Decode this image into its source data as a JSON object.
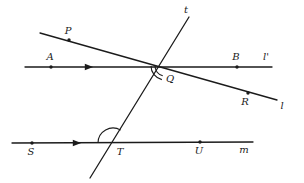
{
  "figure": {
    "kind": "geometry-diagram",
    "background_color": "#ffffff",
    "stroke_color": "#1b1b1b",
    "label_color": "#1b1b1b"
  },
  "lines": [
    {
      "name": "line-l-prime",
      "label": "l'",
      "label_x": 266,
      "label_y": 57,
      "x1": 25,
      "y1": 67,
      "x2": 272,
      "y2": 67,
      "tick_marks": 1
    },
    {
      "name": "line-l",
      "label": "l",
      "label_x": 282,
      "label_y": 106,
      "x1": 40,
      "y1": 33,
      "x2": 277,
      "y2": 100,
      "tick_marks": 0
    },
    {
      "name": "line-m",
      "label": "m",
      "label_x": 244,
      "label_y": 150,
      "x1": 12,
      "y1": 143,
      "x2": 253,
      "y2": 142,
      "tick_marks": 1
    },
    {
      "name": "line-t",
      "label": "t",
      "label_x": 186,
      "label_y": 10,
      "x1": 90,
      "y1": 178,
      "x2": 189,
      "y2": 17,
      "tick_marks": 0
    }
  ],
  "points": [
    {
      "name": "point-p",
      "label": "P",
      "x": 69,
      "y": 40,
      "label_x": 68,
      "label_y": 31,
      "dot": true
    },
    {
      "name": "point-a",
      "label": "A",
      "x": 51,
      "y": 67,
      "label_x": 50,
      "label_y": 57,
      "dot": true
    },
    {
      "name": "point-b",
      "label": "B",
      "x": 237,
      "y": 67,
      "label_x": 236,
      "label_y": 57,
      "dot": true
    },
    {
      "name": "point-q",
      "label": "Q",
      "x": 165,
      "y": 66,
      "label_x": 170,
      "label_y": 79,
      "dot": false
    },
    {
      "name": "point-r",
      "label": "R",
      "x": 248,
      "y": 93,
      "label_x": 245,
      "label_y": 102,
      "dot": true
    },
    {
      "name": "point-s",
      "label": "S",
      "x": 32,
      "y": 143,
      "label_x": 31,
      "label_y": 152,
      "dot": true
    },
    {
      "name": "point-t",
      "label": "T",
      "x": 113,
      "y": 143,
      "label_x": 120,
      "label_y": 152,
      "dot": false
    },
    {
      "name": "point-u",
      "label": "U",
      "x": 200,
      "y": 142,
      "label_x": 199,
      "label_y": 151,
      "dot": true
    }
  ],
  "arrow_markers": [
    {
      "name": "parallel-arrow-l-prime",
      "x": 89,
      "y": 67,
      "direction": "right"
    },
    {
      "name": "parallel-arrow-m",
      "x": 77,
      "y": 143,
      "direction": "right"
    }
  ],
  "angle_arcs": [
    {
      "name": "angle-arc-q-outer",
      "vertex_x": 165,
      "vertex_y": 66,
      "radius": 14,
      "start_deg": 103,
      "end_deg": 180
    },
    {
      "name": "angle-arc-q-inner",
      "vertex_x": 165,
      "vertex_y": 66,
      "radius": 10,
      "start_deg": 103,
      "end_deg": 180
    },
    {
      "name": "angle-arc-t",
      "vertex_x": 113,
      "vertex_y": 143,
      "radius": 15,
      "start_deg": 180,
      "end_deg": 301
    }
  ]
}
